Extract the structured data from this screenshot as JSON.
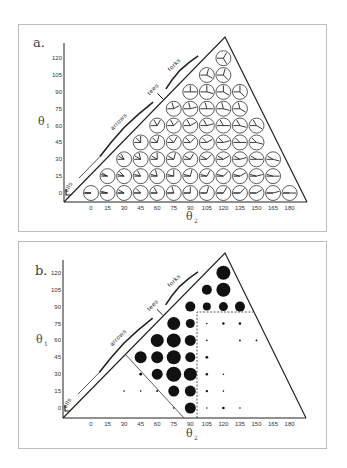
{
  "figure": {
    "panels": [
      {
        "id": "a",
        "label": "a.",
        "type": "junction-glyph-grid",
        "y_axis_title": "θ",
        "y_axis_sub": "1",
        "x_axis_title": "θ",
        "x_axis_sub": "2",
        "y_ticks": [
          "0",
          "15",
          "30",
          "45",
          "60",
          "75",
          "90",
          "105",
          "120"
        ],
        "x_ticks": [
          "0",
          "15",
          "30",
          "45",
          "60",
          "75",
          "90",
          "105",
          "120",
          "135",
          "150",
          "165",
          "180"
        ],
        "region_labels": [
          "ells",
          "arrows",
          "tees",
          "forks"
        ],
        "rows": [
          {
            "theta1": 0,
            "theta2_from": 0,
            "theta2_to": 180
          },
          {
            "theta1": 15,
            "theta2_from": 15,
            "theta2_to": 165
          },
          {
            "theta1": 30,
            "theta2_from": 30,
            "theta2_to": 165
          },
          {
            "theta1": 45,
            "theta2_from": 45,
            "theta2_to": 150
          },
          {
            "theta1": 60,
            "theta2_from": 60,
            "theta2_to": 150
          },
          {
            "theta1": 75,
            "theta2_from": 75,
            "theta2_to": 135
          },
          {
            "theta1": 90,
            "theta2_from": 90,
            "theta2_to": 135
          },
          {
            "theta1": 105,
            "theta2_from": 105,
            "theta2_to": 120
          },
          {
            "theta1": 120,
            "theta2_from": 120,
            "theta2_to": 120
          }
        ]
      },
      {
        "id": "b",
        "label": "b.",
        "type": "bubble-grid",
        "y_axis_title": "θ",
        "y_axis_sub": "1",
        "x_axis_title": "θ",
        "x_axis_sub": "2",
        "y_ticks": [
          "0",
          "15",
          "30",
          "45",
          "60",
          "75",
          "90",
          "105",
          "120"
        ],
        "x_ticks": [
          "0",
          "15",
          "30",
          "45",
          "60",
          "75",
          "90",
          "105",
          "120",
          "135",
          "150",
          "165",
          "180"
        ],
        "region_labels": [
          "ells",
          "arrows",
          "tees",
          "forks"
        ],
        "dots": [
          {
            "theta1": 120,
            "theta2": 120,
            "r": 7
          },
          {
            "theta1": 105,
            "theta2": 105,
            "r": 5
          },
          {
            "theta1": 105,
            "theta2": 120,
            "r": 7
          },
          {
            "theta1": 90,
            "theta2": 90,
            "r": 5
          },
          {
            "theta1": 90,
            "theta2": 105,
            "r": 4
          },
          {
            "theta1": 90,
            "theta2": 120,
            "r": 4.5
          },
          {
            "theta1": 90,
            "theta2": 135,
            "r": 5
          },
          {
            "theta1": 75,
            "theta2": 75,
            "r": 6.5
          },
          {
            "theta1": 75,
            "theta2": 90,
            "r": 4.5
          },
          {
            "theta1": 75,
            "theta2": 105,
            "r": 0.8
          },
          {
            "theta1": 75,
            "theta2": 120,
            "r": 1.2
          },
          {
            "theta1": 75,
            "theta2": 135,
            "r": 1.3
          },
          {
            "theta1": 60,
            "theta2": 60,
            "r": 6.5
          },
          {
            "theta1": 60,
            "theta2": 75,
            "r": 7
          },
          {
            "theta1": 60,
            "theta2": 90,
            "r": 5.5
          },
          {
            "theta1": 60,
            "theta2": 105,
            "r": 0.8
          },
          {
            "theta1": 60,
            "theta2": 135,
            "r": 0.9
          },
          {
            "theta1": 60,
            "theta2": 150,
            "r": 0.9
          },
          {
            "theta1": 45,
            "theta2": 45,
            "r": 6
          },
          {
            "theta1": 45,
            "theta2": 60,
            "r": 6
          },
          {
            "theta1": 45,
            "theta2": 75,
            "r": 7
          },
          {
            "theta1": 45,
            "theta2": 90,
            "r": 5
          },
          {
            "theta1": 45,
            "theta2": 105,
            "r": 1.4
          },
          {
            "theta1": 30,
            "theta2": 45,
            "r": 1.4
          },
          {
            "theta1": 30,
            "theta2": 60,
            "r": 5.5
          },
          {
            "theta1": 30,
            "theta2": 75,
            "r": 7.5
          },
          {
            "theta1": 30,
            "theta2": 90,
            "r": 6.5
          },
          {
            "theta1": 30,
            "theta2": 105,
            "r": 1.2
          },
          {
            "theta1": 30,
            "theta2": 120,
            "r": 0.8
          },
          {
            "theta1": 15,
            "theta2": 30,
            "r": 0.8
          },
          {
            "theta1": 15,
            "theta2": 45,
            "r": 0.8
          },
          {
            "theta1": 15,
            "theta2": 60,
            "r": 1
          },
          {
            "theta1": 15,
            "theta2": 75,
            "r": 5.5
          },
          {
            "theta1": 15,
            "theta2": 90,
            "r": 5.5
          },
          {
            "theta1": 15,
            "theta2": 105,
            "r": 1.2
          },
          {
            "theta1": 15,
            "theta2": 120,
            "r": 0.8
          },
          {
            "theta1": 0,
            "theta2": 75,
            "r": 0.8
          },
          {
            "theta1": 0,
            "theta2": 90,
            "r": 5.5
          },
          {
            "theta1": 0,
            "theta2": 105,
            "r": 0.8
          },
          {
            "theta1": 0,
            "theta2": 120,
            "r": 1.3
          },
          {
            "theta1": 0,
            "theta2": 135,
            "r": 0.8
          }
        ]
      }
    ]
  },
  "chart_data": [
    {
      "type": "scatter",
      "title": "a.",
      "xlabel": "θ2",
      "ylabel": "θ1",
      "x_ticks": [
        0,
        15,
        30,
        45,
        60,
        75,
        90,
        105,
        120,
        135,
        150,
        165,
        180
      ],
      "y_ticks": [
        0,
        15,
        30,
        45,
        60,
        75,
        90,
        105,
        120
      ],
      "annotations": [
        "ells",
        "arrows",
        "tees",
        "forks"
      ],
      "note": "Each grid point shows a three-armed junction glyph with arm angles defined by θ1 and θ2"
    },
    {
      "type": "scatter",
      "title": "b.",
      "xlabel": "θ2",
      "ylabel": "θ1",
      "x_ticks": [
        0,
        15,
        30,
        45,
        60,
        75,
        90,
        105,
        120,
        135,
        150,
        165,
        180
      ],
      "y_ticks": [
        0,
        15,
        30,
        45,
        60,
        75,
        90,
        105,
        120
      ],
      "annotations": [
        "ells",
        "arrows",
        "tees",
        "forks"
      ],
      "note": "Bubble size encodes frequency; dashed rectangle bounds θ2 ≥ ~97.5, θ1 ≤ ~82.5; solid diagonal bounds lower-left region"
    }
  ]
}
